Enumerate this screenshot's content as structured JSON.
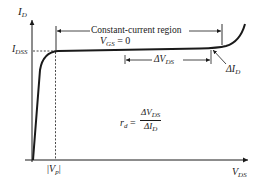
{
  "diagram": {
    "axes": {
      "y_label": {
        "main": "I",
        "sub": "D"
      },
      "x_label": {
        "main": "V",
        "sub": "DS"
      }
    },
    "labels": {
      "idss": {
        "main": "I",
        "sub": "DSS"
      },
      "region": "Constant-current region",
      "vgs": {
        "main": "V",
        "sub": "GS",
        "rest": " = 0"
      },
      "delta_vds": {
        "prefix": "ΔV",
        "sub": "DS"
      },
      "delta_id": {
        "prefix": "ΔI",
        "sub": "D"
      },
      "vp": {
        "bar_left": "|",
        "main": "V",
        "sub": "p",
        "bar_right": "|"
      },
      "rd": {
        "lhs_main": "r",
        "lhs_sub": "d",
        "eq": " = ",
        "num_prefix": "ΔV",
        "num_sub": "DS",
        "den_prefix": "ΔI",
        "den_sub": "D"
      }
    },
    "colors": {
      "ink": "#1a1a1a",
      "background": "#ffffff"
    }
  }
}
